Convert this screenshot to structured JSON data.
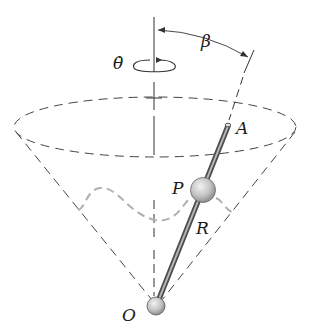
{
  "figure": {
    "labels": {
      "theta_dot": "θ̇",
      "beta": "β",
      "A": "A",
      "P": "P",
      "R": "R",
      "O": "O"
    },
    "colors": {
      "line": "#333333",
      "dashed_path": "#b0b0b0",
      "rod": "#8a8a8a",
      "ball_fill": "#c8c8c8",
      "background": "#ffffff"
    }
  }
}
